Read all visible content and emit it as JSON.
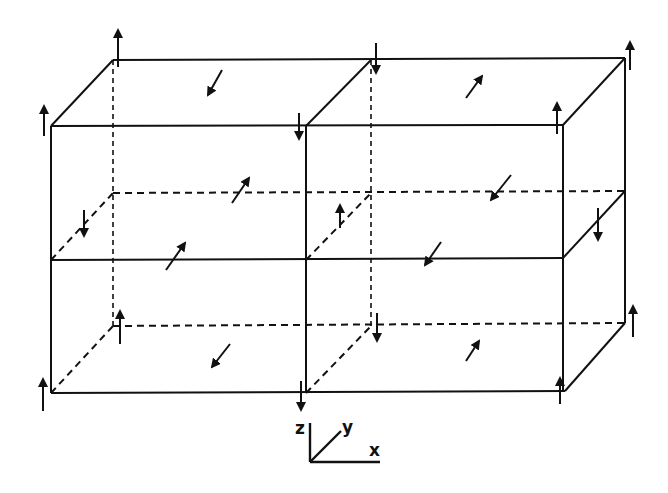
{
  "diagram": {
    "type": "magnetic-spin-lattice",
    "colors": {
      "ink": "#111111",
      "background": "#ffffff"
    },
    "axes": {
      "z_label": "z",
      "y_label": "y",
      "x_label": "x"
    },
    "spins": {
      "corner": [
        {
          "pos": "back-top-left",
          "dir": "up"
        },
        {
          "pos": "front-top-left",
          "dir": "up"
        },
        {
          "pos": "back-top-middle",
          "dir": "down"
        },
        {
          "pos": "front-top-middle",
          "dir": "down"
        },
        {
          "pos": "back-top-right",
          "dir": "up"
        },
        {
          "pos": "front-top-right",
          "dir": "up"
        },
        {
          "pos": "back-mid-left",
          "dir": "down"
        },
        {
          "pos": "back-mid-middle",
          "dir": "up"
        },
        {
          "pos": "back-mid-right",
          "dir": "down"
        },
        {
          "pos": "back-bottom-left",
          "dir": "up"
        },
        {
          "pos": "back-bottom-middle",
          "dir": "down"
        },
        {
          "pos": "back-bottom-right",
          "dir": "up"
        },
        {
          "pos": "front-bottom-left",
          "dir": "up"
        },
        {
          "pos": "front-bottom-middle",
          "dir": "down"
        },
        {
          "pos": "front-bottom-right",
          "dir": "up"
        }
      ],
      "face": [
        {
          "pos": "top-left",
          "dir": "toward-viewer"
        },
        {
          "pos": "top-right",
          "dir": "away"
        },
        {
          "pos": "mid-left-back",
          "dir": "away"
        },
        {
          "pos": "mid-right-back",
          "dir": "toward-viewer"
        },
        {
          "pos": "mid-left-front",
          "dir": "away"
        },
        {
          "pos": "mid-right-front",
          "dir": "toward-viewer"
        },
        {
          "pos": "bottom-left",
          "dir": "toward-viewer"
        },
        {
          "pos": "bottom-right",
          "dir": "away"
        }
      ]
    }
  }
}
